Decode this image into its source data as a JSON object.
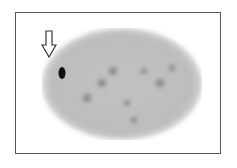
{
  "figure": {
    "type": "scintigraphy-scan",
    "annotation": "arrow pointing to focal uptake",
    "colors": {
      "frame": "#555555",
      "background": "#ffffff",
      "organ": "#bdbdbd",
      "hotspot": "#111111"
    }
  }
}
